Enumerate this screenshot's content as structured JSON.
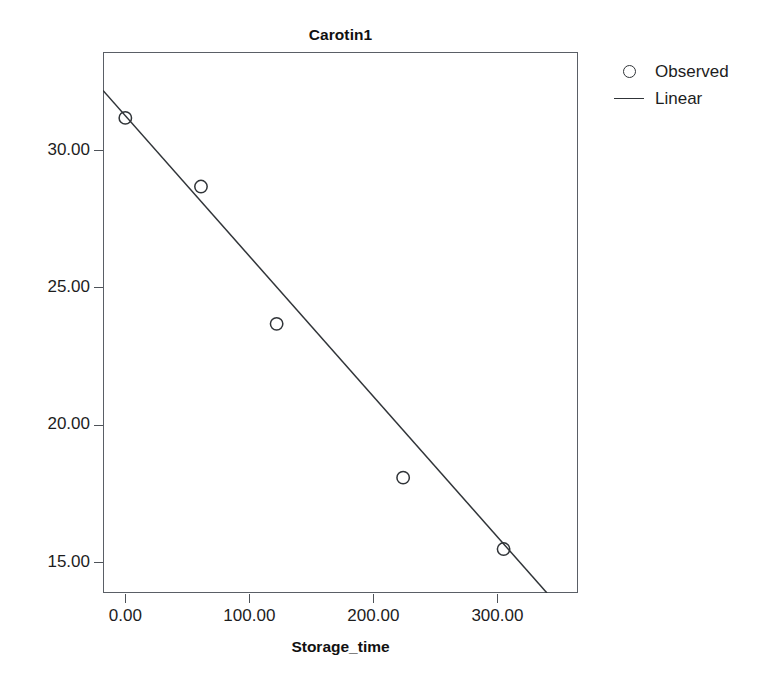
{
  "chart_data": {
    "type": "scatter",
    "title": "Carotin1",
    "xlabel": "Storage_time",
    "ylabel": "",
    "xlim": [
      -18,
      365
    ],
    "ylim": [
      13.9,
      33.6
    ],
    "grid": false,
    "legend_position": "right-top",
    "x_ticks": [
      0,
      100,
      200,
      300
    ],
    "x_tick_labels": [
      "0.00",
      "100.00",
      "200.00",
      "300.00"
    ],
    "y_ticks": [
      15,
      20,
      25,
      30
    ],
    "y_tick_labels": [
      "15.00",
      "20.00",
      "25.00",
      "30.00"
    ],
    "series": [
      {
        "name": "Observed",
        "type": "scatter",
        "marker": "open-circle",
        "color": "#303438",
        "x": [
          0,
          61,
          122,
          224,
          305
        ],
        "y": [
          31.2,
          28.7,
          23.7,
          18.1,
          15.5
        ],
        "points": [
          {
            "x": 0,
            "y": 31.2
          },
          {
            "x": 61,
            "y": 28.7
          },
          {
            "x": 122,
            "y": 23.7
          },
          {
            "x": 224,
            "y": 18.1
          },
          {
            "x": 305,
            "y": 15.5
          }
        ]
      },
      {
        "name": "Linear",
        "type": "line",
        "color": "#303438",
        "fit": "linear",
        "endpoints": [
          {
            "x": -18,
            "y": 32.2
          },
          {
            "x": 340,
            "y": 13.9
          }
        ]
      }
    ]
  },
  "legend": {
    "items": [
      {
        "label": "Observed",
        "key": "open-circle"
      },
      {
        "label": "Linear",
        "key": "line"
      }
    ]
  },
  "axes": {
    "x_title": "Storage_time",
    "y_tick_labels": [
      "30.00",
      "25.00",
      "20.00",
      "15.00"
    ],
    "x_tick_labels": [
      "0.00",
      "100.00",
      "200.00",
      "300.00"
    ]
  },
  "title": "Carotin1"
}
